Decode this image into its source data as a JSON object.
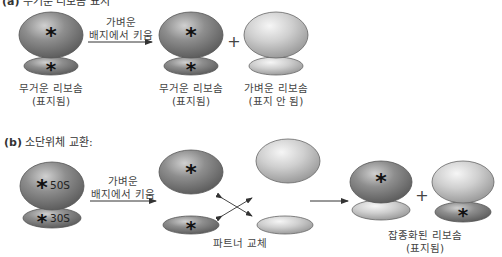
{
  "figure": {
    "panel_a": {
      "title_prefix": "(a)",
      "title_text": "무거운 리보솜 표지",
      "arrow_label_line1": "가벼운",
      "arrow_label_line2": "배지에서 키움",
      "plus": "+",
      "start_label_line1": "무거운 리보솜",
      "start_label_line2": "(표지됨)",
      "result_heavy_line1": "무거운 리보솜",
      "result_heavy_line2": "(표지됨)",
      "result_light_line1": "가벼운 리보솜",
      "result_light_line2": "(표지 안 됨)"
    },
    "panel_b": {
      "title_prefix": "(b)",
      "title_text": "소단위체 교환:",
      "large_subunit": "50S",
      "small_subunit": "30S",
      "arrow_label_line1": "가벼운",
      "arrow_label_line2": "배지에서 키움",
      "exchange_label": "파트너 교체",
      "plus": "+",
      "hybrid_label_line1": "잡종화된 리보솜",
      "hybrid_label_line2": "(표지됨)"
    },
    "marker_symbol": "*",
    "colors": {
      "heavy_fill": "#8a8a8a",
      "light_fill": "#d2d2d2",
      "outline": "#555555",
      "arrow": "#333333"
    }
  }
}
